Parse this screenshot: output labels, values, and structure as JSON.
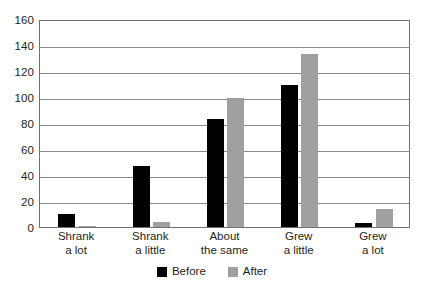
{
  "chart_data": {
    "type": "bar",
    "title": "",
    "subtitle": "",
    "xlabel": "",
    "ylabel": "",
    "ylim": [
      0,
      160
    ],
    "ytick_step": 20,
    "yticks": [
      160,
      140,
      120,
      100,
      80,
      60,
      40,
      20,
      0
    ],
    "grid": true,
    "grid_axis": "y",
    "legend_position": "bottom-center",
    "categories": [
      "Shrank a lot",
      "Shrank a little",
      "About the same",
      "Grew a little",
      "Grew a lot"
    ],
    "category_lines": [
      [
        "Shrank",
        "a lot"
      ],
      [
        "Shrank",
        "a little"
      ],
      [
        "About",
        "the same"
      ],
      [
        "Grew",
        "a little"
      ],
      [
        "Grew",
        "a lot"
      ]
    ],
    "series": [
      {
        "name": "Before",
        "color": "#010101",
        "values": [
          10,
          47,
          83,
          109,
          3
        ]
      },
      {
        "name": "After",
        "color": "#a0a0a0",
        "values": [
          1,
          4,
          99,
          133,
          14
        ]
      }
    ]
  },
  "colors": {
    "before": "#010101",
    "after": "#a0a0a0",
    "gridline": "#8b8c8e",
    "frame": "#6f7072",
    "text": "#231f20",
    "background": "#ffffff"
  }
}
